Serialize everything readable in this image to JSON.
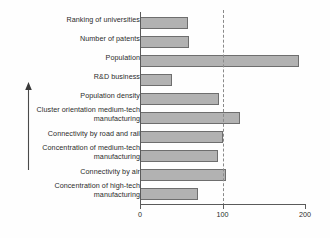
{
  "chart_data": {
    "type": "bar",
    "orientation": "horizontal",
    "title": "",
    "xlabel": "",
    "ylabel": "",
    "xlim": [
      0,
      200
    ],
    "xticks": [
      0,
      100,
      200
    ],
    "xtick_labels": [
      "0",
      "100",
      "200"
    ],
    "grid": false,
    "legend": false,
    "reference_line": {
      "value": 100,
      "style": "dashed",
      "color": "#8a8a8a"
    },
    "bar_style": {
      "fill": "#b2b2b2",
      "edge": "#6e6e6e"
    },
    "annotations": [
      {
        "name": "increasing-importance-arrow",
        "type": "arrow",
        "direction": "up",
        "label": ""
      }
    ],
    "categories": [
      "Ranking of universities",
      "Number of patents",
      "Population",
      "R&D business",
      "Population density",
      "Cluster orientation medium-tech\nmanufacturing",
      "Connectivity by road and rail",
      "Concentration of medium-tech\nmanufacturing",
      "Connectivity by air",
      "Concentration of high-tech\nmanufacturing"
    ],
    "values": [
      58,
      59,
      193,
      39,
      96,
      121,
      100,
      95,
      104,
      70
    ]
  }
}
